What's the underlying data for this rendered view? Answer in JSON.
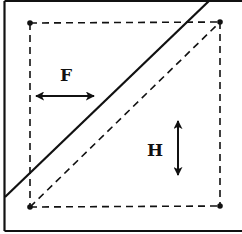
{
  "diagram": {
    "labels": {
      "f": "F",
      "h": "H"
    },
    "colors": {
      "ink": "#111111",
      "background": "#ffffff"
    },
    "frame": {
      "left": 4,
      "top": 1,
      "right": 246,
      "bottom": 231
    },
    "corner_points": [
      {
        "name": "top-left",
        "x": 30,
        "y": 23
      },
      {
        "name": "top-right",
        "x": 220,
        "y": 22
      },
      {
        "name": "bottom-left",
        "x": 30,
        "y": 207
      },
      {
        "name": "bottom-right",
        "x": 220,
        "y": 206
      }
    ],
    "solid_diagonal": {
      "x1": 5,
      "y1": 197,
      "x2": 210,
      "y2": 0
    },
    "dashed_diagonal": {
      "x1": 30,
      "y1": 207,
      "x2": 220,
      "y2": 22
    },
    "f_arrow": {
      "direction": "horizontal",
      "x1": 35,
      "x2": 95,
      "y": 96
    },
    "h_arrow": {
      "direction": "vertical",
      "x": 178,
      "y1": 120,
      "y2": 176
    }
  }
}
